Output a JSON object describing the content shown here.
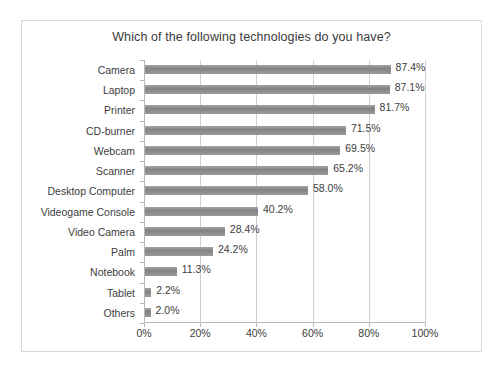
{
  "chart_data": {
    "type": "bar",
    "orientation": "horizontal",
    "title": "Which of the following technologies do you have?",
    "xlabel": "",
    "ylabel": "",
    "xlim": [
      0,
      100
    ],
    "xticks": [
      "0%",
      "20%",
      "40%",
      "60%",
      "80%",
      "100%"
    ],
    "xtick_values": [
      0,
      20,
      40,
      60,
      80,
      100
    ],
    "grid": true,
    "legend": false,
    "bar_color": "#8a8a8a",
    "categories": [
      "Camera",
      "Laptop",
      "Printer",
      "CD-burner",
      "Webcam",
      "Scanner",
      "Desktop Computer",
      "Videogame Console",
      "Video Camera",
      "Palm",
      "Notebook",
      "Tablet",
      "Others"
    ],
    "values": [
      87.4,
      87.1,
      81.7,
      71.5,
      69.5,
      65.2,
      58.0,
      40.2,
      28.4,
      24.2,
      11.3,
      2.2,
      2.0
    ],
    "data_labels": [
      "87.4%",
      "87.1%",
      "81.7%",
      "71.5%",
      "69.5%",
      "65.2%",
      "58.0%",
      "40.2%",
      "28.4%",
      "24.2%",
      "11.3%",
      "2.2%",
      "2.0%"
    ]
  },
  "figure": {
    "caption": ""
  }
}
